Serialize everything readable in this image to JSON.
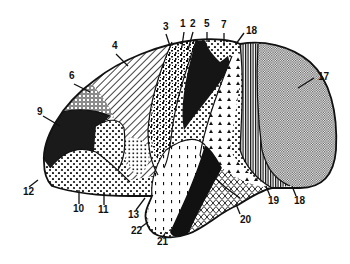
{
  "figure": {
    "type": "brain-cortical-area-map",
    "view": "lateral",
    "colors": {
      "ink": "#111111",
      "background": "#ffffff"
    }
  },
  "labels": [
    {
      "id": "1",
      "text": "1",
      "x": 180,
      "y": 27
    },
    {
      "id": "2",
      "text": "2",
      "x": 190,
      "y": 27
    },
    {
      "id": "3",
      "text": "3",
      "x": 163,
      "y": 30
    },
    {
      "id": "4",
      "text": "4",
      "x": 112,
      "y": 49
    },
    {
      "id": "5",
      "text": "5",
      "x": 204,
      "y": 27
    },
    {
      "id": "6",
      "text": "6",
      "x": 69,
      "y": 79
    },
    {
      "id": "7",
      "text": "7",
      "x": 221,
      "y": 28
    },
    {
      "id": "8",
      "text": "18",
      "x": 246,
      "y": 34
    },
    {
      "id": "9",
      "text": "9",
      "x": 37,
      "y": 115
    },
    {
      "id": "10",
      "text": "10",
      "x": 73,
      "y": 212
    },
    {
      "id": "11",
      "text": "11",
      "x": 98,
      "y": 213
    },
    {
      "id": "12",
      "text": "12",
      "x": 23,
      "y": 195
    },
    {
      "id": "13",
      "text": "13",
      "x": 128,
      "y": 218
    },
    {
      "id": "14",
      "text": "17",
      "x": 318,
      "y": 80
    },
    {
      "id": "15",
      "text": "18",
      "x": 294,
      "y": 204
    },
    {
      "id": "16",
      "text": "19",
      "x": 268,
      "y": 204
    },
    {
      "id": "17",
      "text": "20",
      "x": 240,
      "y": 223
    },
    {
      "id": "18",
      "text": "21",
      "x": 157,
      "y": 245
    },
    {
      "id": "19",
      "text": "22",
      "x": 131,
      "y": 234
    }
  ]
}
